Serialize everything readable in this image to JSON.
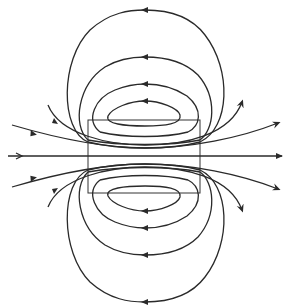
{
  "diagram": {
    "type": "magnetic-field-lines",
    "colors": {
      "stroke": "#2a2a2a",
      "background": "#ffffff"
    },
    "rectangle": {
      "x": 88,
      "y": 120,
      "width": 112,
      "height": 73
    },
    "axis_line": {
      "y": 156,
      "x1": 8,
      "x2": 282,
      "arrow_direction": "right"
    },
    "closed_loops_top": [
      {
        "id": "top-1",
        "apex_y": 10,
        "x_min": 65,
        "x_max": 225,
        "arrow": "left"
      },
      {
        "id": "top-2",
        "apex_y": 57,
        "x_min": 80,
        "x_max": 212,
        "arrow": "left"
      },
      {
        "id": "top-3",
        "apex_y": 84,
        "x_min": 93,
        "x_max": 200,
        "arrow": "left"
      },
      {
        "id": "top-4",
        "apex_y": 101,
        "x_min": 108,
        "x_max": 180,
        "arrow": "left"
      }
    ],
    "closed_loops_bottom": [
      {
        "id": "bottom-1",
        "apex_y": 302,
        "arrow": "left"
      },
      {
        "id": "bottom-2",
        "apex_y": 255,
        "arrow": "left"
      },
      {
        "id": "bottom-3",
        "apex_y": 228,
        "arrow": "left"
      },
      {
        "id": "bottom-4",
        "apex_y": 211,
        "arrow": "left"
      }
    ],
    "open_lines": [
      {
        "id": "upper-outer",
        "arrow": "right"
      },
      {
        "id": "upper-inner",
        "arrow": "right"
      },
      {
        "id": "lower-outer",
        "arrow": "right"
      },
      {
        "id": "lower-inner",
        "arrow": "right"
      }
    ]
  }
}
